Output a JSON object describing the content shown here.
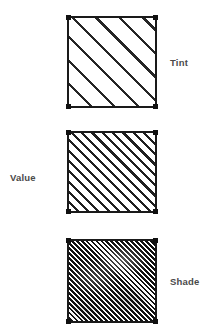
{
  "diagram": {
    "title_label": "Value",
    "canvas": {
      "width": 207,
      "height": 336,
      "background": "#ffffff"
    },
    "ink_color": "#1a1a1a",
    "text_color": "#4a4a4a",
    "axis_label": {
      "text": "Value",
      "position": "left-middle"
    },
    "swatches": [
      {
        "id": "tint",
        "label": "Tint",
        "label_position": "right",
        "hatch_density": "sparse",
        "hatch_angle_deg": 45,
        "hatch_spacing_px": 16.6,
        "fill": "#ffffff",
        "border_color": "#1a1a1a",
        "x": 67,
        "y": 16,
        "width": 90,
        "height": 92
      },
      {
        "id": "value",
        "label": "",
        "label_position": "none",
        "hatch_density": "medium",
        "hatch_angle_deg": 45,
        "hatch_spacing_px": 7.3,
        "fill": "#ffffff",
        "border_color": "#1a1a1a",
        "x": 67,
        "y": 131,
        "width": 90,
        "height": 82
      },
      {
        "id": "shade",
        "label": "Shade",
        "label_position": "right",
        "hatch_density": "dense",
        "hatch_angle_deg": 45,
        "hatch_spacing_px": 3.5,
        "fill": "#ffffff",
        "border_color": "#1a1a1a",
        "x": 67,
        "y": 239,
        "width": 90,
        "height": 84
      }
    ]
  }
}
